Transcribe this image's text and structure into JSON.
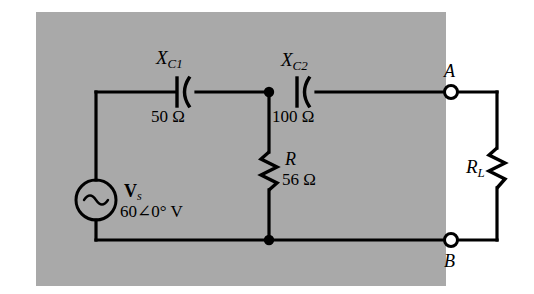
{
  "figure": {
    "type": "circuit-schematic",
    "background_color": "#a9a9a9",
    "page_color": "#ffffff",
    "line_color": "#000000"
  },
  "source": {
    "symbol": "ac-source-sine",
    "label": "V",
    "label_subscript": "s",
    "value": "60∠0° V"
  },
  "components": {
    "c1": {
      "symbol": "capacitor",
      "name": "X",
      "name_subscript": "C1",
      "value": "50 Ω"
    },
    "c2": {
      "symbol": "capacitor",
      "name": "X",
      "name_subscript": "C2",
      "value": "100 Ω"
    },
    "r": {
      "symbol": "resistor",
      "name": "R",
      "value": "56 Ω"
    },
    "rl": {
      "symbol": "resistor",
      "name": "R",
      "name_subscript": "L",
      "value": ""
    }
  },
  "terminals": [
    {
      "id": "a",
      "label": "A",
      "symbol": "open-terminal"
    },
    {
      "id": "b",
      "label": "B",
      "symbol": "open-terminal"
    }
  ],
  "nodes": [
    {
      "id": "top-junction",
      "symbol": "junction-dot"
    },
    {
      "id": "bottom-junction",
      "symbol": "junction-dot"
    }
  ]
}
